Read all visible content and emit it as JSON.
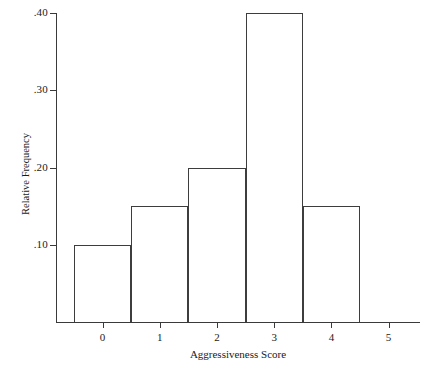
{
  "chart_data": {
    "type": "bar",
    "title": "",
    "xlabel": "Aggressiveness Score",
    "ylabel": "Relative Frequency",
    "categories": [
      "0",
      "1",
      "2",
      "3",
      "4"
    ],
    "values": [
      0.1,
      0.15,
      0.2,
      0.4,
      0.15
    ],
    "x_tick_labels": [
      "0",
      "1",
      "2",
      "3",
      "4",
      "5"
    ],
    "y_tick_labels": [
      ".10",
      ".20",
      ".30",
      ".40"
    ],
    "y_tick_values": [
      0.1,
      0.2,
      0.3,
      0.4
    ],
    "xlim": [
      -0.75,
      5.75
    ],
    "ylim": [
      0,
      0.42
    ],
    "bin_edges": [
      -0.5,
      0.5,
      1.5,
      2.5,
      3.5,
      4.5
    ],
    "grid": false,
    "legend": "none",
    "bar_fill": "#ffffff",
    "bar_edge_color": "#3d3d3d",
    "axis_color": "#3a3a3a",
    "background": "#ffffff"
  }
}
